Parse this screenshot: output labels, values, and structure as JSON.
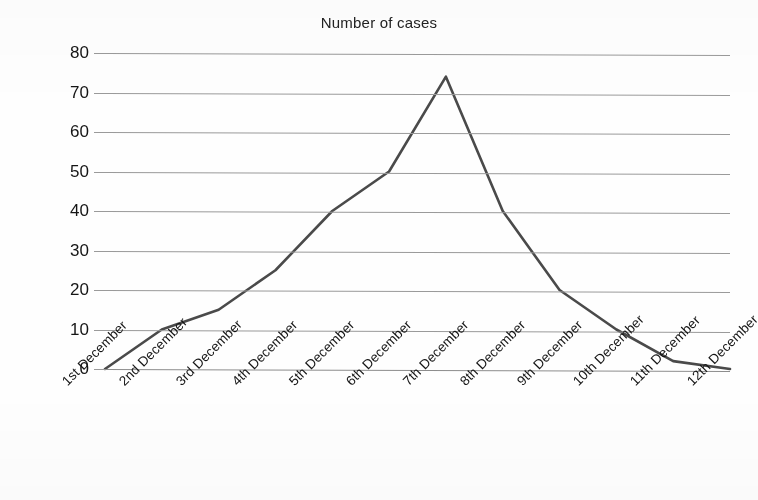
{
  "chart_data": {
    "type": "line",
    "title": "Number of cases",
    "xlabel": "",
    "ylabel": "",
    "categories": [
      "1st December",
      "2nd December",
      "3rd December",
      "4th December",
      "5th December",
      "6th December",
      "7th December",
      "8th December",
      "9th December",
      "10th December",
      "11th December",
      "12th December"
    ],
    "values": [
      0,
      10,
      15,
      25,
      40,
      50,
      74,
      40,
      20,
      10,
      2,
      0
    ],
    "ylim": [
      0,
      80
    ],
    "ytick_labels": [
      "80",
      "70",
      "60",
      "50",
      "40",
      "30",
      "20",
      "10",
      "0"
    ],
    "ytick_values": [
      80,
      70,
      60,
      50,
      40,
      30,
      20,
      10,
      0
    ],
    "ytick_step": 10,
    "grid": "horizontal",
    "legend": "none",
    "series_name": "Number of cases",
    "line_color": "#4a4a4a",
    "grid_color": "#9a9a9a",
    "text_color": "#141414",
    "background_color": "#fefefe",
    "xtick_rotation_degrees": -45
  }
}
